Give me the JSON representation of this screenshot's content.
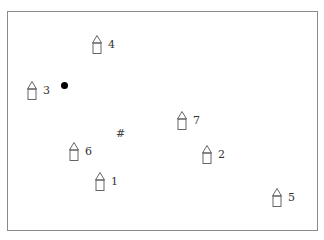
{
  "diagram": {
    "frame": {
      "border_color": "#8a8a8a"
    },
    "houses": [
      {
        "label": "1",
        "x": 100,
        "y": 172
      },
      {
        "label": "2",
        "x": 207,
        "y": 145
      },
      {
        "label": "3",
        "x": 32,
        "y": 81
      },
      {
        "label": "4",
        "x": 97,
        "y": 35
      },
      {
        "label": "5",
        "x": 277,
        "y": 188
      },
      {
        "label": "6",
        "x": 74,
        "y": 142
      },
      {
        "label": "7",
        "x": 182,
        "y": 111
      }
    ],
    "agent_dot": {
      "icon": "filled-circle",
      "x": 64,
      "y": 85
    },
    "goal_marker": {
      "symbol": "#",
      "x": 120,
      "y": 134
    }
  }
}
